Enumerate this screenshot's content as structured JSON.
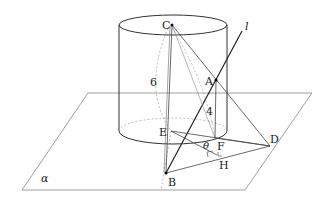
{
  "diagram": {
    "type": "3d-geometry",
    "labels": {
      "C": "C",
      "A": "A",
      "B": "B",
      "D": "D",
      "E": "E",
      "F": "F",
      "H": "H",
      "line": "l",
      "plane": "α",
      "angle": "θ",
      "height_cylinder": "6",
      "height_AF": "4"
    },
    "colors": {
      "stroke": "#333333",
      "thin_stroke": "#777777",
      "dashed": "#999999"
    }
  }
}
